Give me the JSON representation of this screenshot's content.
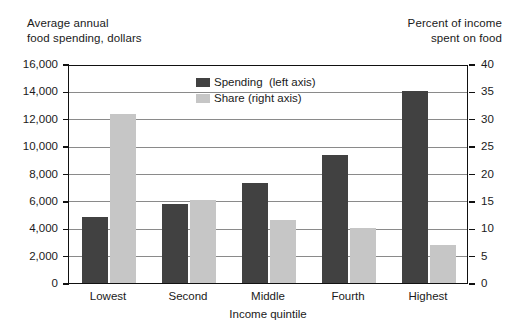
{
  "chart_data": {
    "type": "bar",
    "title": "",
    "subtitle": "",
    "categories": [
      "Lowest",
      "Second",
      "Middle",
      "Fourth",
      "Highest"
    ],
    "xlabel": "Income  quintile",
    "series": [
      {
        "name": "Spending  (left axis)",
        "axis": "left",
        "color": "#414141",
        "values": [
          4800,
          5800,
          7300,
          9350,
          14000
        ]
      },
      {
        "name": "Share (right axis)",
        "axis": "right",
        "color": "#c6c6c6",
        "values": [
          30.8,
          15.2,
          11.6,
          10.0,
          7.0
        ]
      }
    ],
    "left_axis": {
      "label": "Average annual\nfood spending,  dollars",
      "ylim": [
        0,
        16000
      ],
      "ticks": [
        0,
        2000,
        4000,
        6000,
        8000,
        10000,
        12000,
        14000,
        16000
      ],
      "ticklabels": [
        "0",
        "2,000",
        "4,000",
        "6,000",
        "8,000",
        "10,000",
        "12,000",
        "14,000",
        "16,000"
      ]
    },
    "right_axis": {
      "label": "Percent of income\nspent on food",
      "ylim": [
        0,
        40
      ],
      "ticks": [
        0,
        5,
        10,
        15,
        20,
        25,
        30,
        35,
        40
      ],
      "ticklabels": [
        "0",
        "5",
        "10",
        "15",
        "20",
        "25",
        "30",
        "35",
        "40"
      ]
    },
    "grid": true,
    "legend_position": "inside-top-center",
    "legend": [
      {
        "label": "Spending  (left axis)",
        "color": "#414141"
      },
      {
        "label": "Share (right axis)",
        "color": "#c6c6c6"
      }
    ]
  }
}
